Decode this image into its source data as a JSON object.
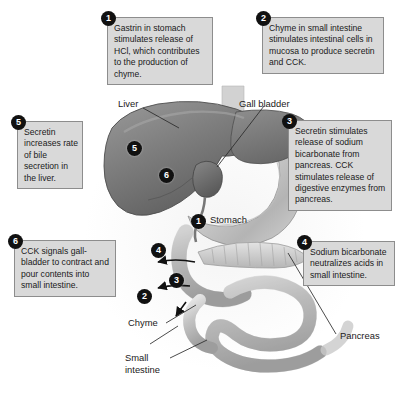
{
  "diagram": {
    "background_color": "#ffffff",
    "box_fill": "#d9d9d9",
    "box_border": "#8d8d8d",
    "badge_color": "#111111"
  },
  "callouts": [
    {
      "number": "1",
      "text": "Gastrin in stomach stimulates release of HCl, which contributes to the production of chyme."
    },
    {
      "number": "2",
      "text": "Chyme in small intestine stimulates intestinal cells in mucosa to produce secretin and CCK."
    },
    {
      "number": "3",
      "text": "Secretin stimulates release of sodium bicarbonate from pancreas. CCK stimulates release of digestive enzymes from pancreas."
    },
    {
      "number": "4",
      "text": "Sodium bicarbonate neutralizes acids in small intestine."
    },
    {
      "number": "5",
      "text": "Secretin increases rate of bile secretion in the liver."
    },
    {
      "number": "6",
      "text": "CCK signals gall-bladder to contract and pour contents into small intestine."
    }
  ],
  "organ_labels": [
    {
      "name": "liver",
      "text": "Liver"
    },
    {
      "name": "gall-bladder",
      "text": "Gall bladder"
    },
    {
      "name": "stomach",
      "text": "Stomach"
    },
    {
      "name": "chyme",
      "text": "Chyme"
    },
    {
      "name": "small-intestine",
      "text": "Small\nintestine"
    },
    {
      "name": "pancreas",
      "text": "Pancreas"
    }
  ],
  "anatomy_markers": [
    {
      "number": "1",
      "at": "stomach"
    },
    {
      "number": "2",
      "at": "small-intestine-mucosa"
    },
    {
      "number": "3",
      "at": "pancreatic-duct"
    },
    {
      "number": "4",
      "at": "duodenum"
    },
    {
      "number": "5",
      "at": "liver"
    },
    {
      "number": "6",
      "at": "gall-bladder"
    }
  ]
}
